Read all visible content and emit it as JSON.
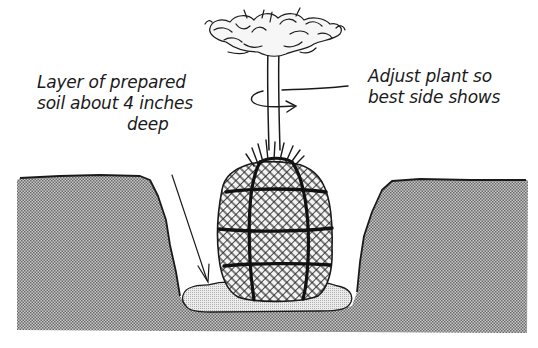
{
  "figure": {
    "colors": {
      "ink": "#1a1a1a",
      "ground_fill": "#a8a8a8",
      "soil_pad_fill": "#dcdcdc",
      "background": "#ffffff"
    }
  },
  "annotations": {
    "soil_layer": {
      "lines": [
        "Layer of prepared",
        "soil about 4 inches",
        "deep"
      ]
    },
    "adjust_plant": {
      "lines": [
        "Adjust plant so",
        "best side shows"
      ]
    }
  },
  "elements": {
    "ground": "ground-cross-section",
    "hole": "planting-hole",
    "soil_pad": "prepared-soil-layer",
    "root_ball": "burlap-wrapped-root-ball",
    "trunk": "plant-trunk",
    "foliage": "plant-foliage",
    "rotation_arrow": "rotate-arrow-icon",
    "pointer_arrow": "arrow-down-icon"
  }
}
